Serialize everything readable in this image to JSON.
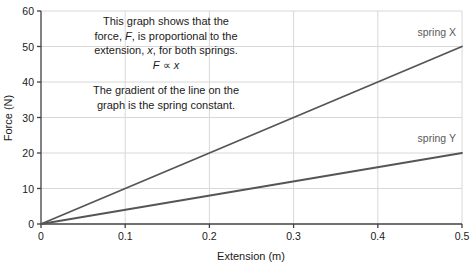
{
  "chart_data": {
    "type": "line",
    "title": "",
    "xlabel": "Extension (m)",
    "ylabel": "Force (N)",
    "xlim": [
      0,
      0.5
    ],
    "ylim": [
      0,
      60
    ],
    "grid": true,
    "legend_position": "inline-right",
    "x_ticks": [
      "0",
      "0.1",
      "0.2",
      "0.3",
      "0.4",
      "0.5"
    ],
    "x_tick_values": [
      0,
      0.1,
      0.2,
      0.3,
      0.4,
      0.5
    ],
    "y_ticks": [
      "0",
      "10",
      "20",
      "30",
      "40",
      "50",
      "60"
    ],
    "y_tick_values": [
      0,
      10,
      20,
      30,
      40,
      50,
      60
    ],
    "x": [
      0,
      0.5
    ],
    "series": [
      {
        "name": "spring X",
        "values": [
          0,
          50
        ],
        "gradient_n_per_m": 100,
        "color": "#555555",
        "label_x": 0.47,
        "label_y": 53
      },
      {
        "name": "spring Y",
        "values": [
          0,
          20
        ],
        "gradient_n_per_m": 40,
        "color": "#555555",
        "label_x": 0.47,
        "label_y": 23
      }
    ],
    "annotations": [
      {
        "id": "proportionality-note",
        "lines": [
          [
            {
              "t": "This graph shows that the",
              "i": false
            }
          ],
          [
            {
              "t": "force, ",
              "i": false
            },
            {
              "t": "F",
              "i": true
            },
            {
              "t": ", is proportional to the",
              "i": false
            }
          ],
          [
            {
              "t": "extension, ",
              "i": false
            },
            {
              "t": "x",
              "i": true
            },
            {
              "t": ", for both springs.",
              "i": false
            }
          ],
          [
            {
              "t": "F",
              "i": true
            },
            {
              "t": " ∝ ",
              "i": false
            },
            {
              "t": "x",
              "i": true
            }
          ]
        ]
      },
      {
        "id": "gradient-note",
        "lines": [
          [
            {
              "t": "The gradient of the line on the",
              "i": false
            }
          ],
          [
            {
              "t": "graph is the spring constant.",
              "i": false
            }
          ]
        ]
      }
    ],
    "colors": {
      "line": "#555555",
      "grid": "#d8d8d8",
      "axis": "#404040",
      "text": "#1a1a1a",
      "series_label": "#5a5a5a",
      "background": "#ffffff"
    }
  }
}
